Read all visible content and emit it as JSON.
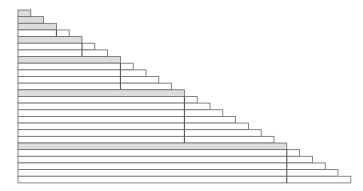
{
  "diagram": {
    "type": "fibonacci-staircase",
    "row_count": 26,
    "origin_x": 18,
    "origin_y": 10,
    "row_height": 6.65,
    "step_width": 12.8,
    "shaded_rows": [
      1,
      2,
      3,
      5,
      8,
      13,
      21
    ],
    "colors": {
      "shade": "#dcdcdc",
      "line": "#6a6a6a",
      "divider": "#444444",
      "background": "#ffffff"
    }
  }
}
